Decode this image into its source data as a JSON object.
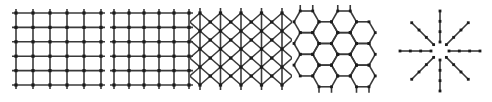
{
  "figure": {
    "background_color": "#ffffff",
    "line_color": "#3a3a3a",
    "node_color": "#1c1c1c",
    "panel_count": 5,
    "width": 492,
    "height": 102
  },
  "panels": [
    {
      "id": "panel-square-grid-1",
      "name": "square-lattice",
      "label": "Square grid",
      "type": "grid",
      "x": 16,
      "y": 13,
      "width": 85,
      "height": 72,
      "cols": 5,
      "rows": 5,
      "node_size": 3.2,
      "has_stubs": true,
      "stub_length": 4
    },
    {
      "id": "panel-square-grid-2",
      "name": "square-lattice-narrow",
      "label": "Square grid narrow",
      "type": "grid",
      "x": 114,
      "y": 13,
      "width": 75,
      "height": 72,
      "cols": 5,
      "rows": 5,
      "node_size": 3.2,
      "has_stubs": true,
      "stub_length": 4
    },
    {
      "id": "panel-triangular",
      "name": "triangular-lattice",
      "label": "Triangular lattice",
      "type": "triangular",
      "x": 200,
      "y": 13,
      "width": 82,
      "height": 72,
      "cols": 4,
      "rows": 4,
      "node_size": 3.2,
      "has_stubs": true,
      "stub_length": 5
    },
    {
      "id": "panel-hexagonal",
      "name": "hexagonal-lattice",
      "label": "Honeycomb lattice",
      "type": "hexagonal",
      "x": 294,
      "y": 11,
      "width": 86,
      "height": 76,
      "cols": 4,
      "rows": 3,
      "hex_radius": 12.5,
      "node_size": 2.8,
      "has_stubs": true,
      "stub_length": 6
    },
    {
      "id": "panel-radial-star",
      "name": "radial-star-lattice",
      "label": "Radial star",
      "type": "star",
      "x": 397,
      "y": 12,
      "width": 86,
      "height": 78,
      "spokes": 8,
      "nodes_per_spoke": 4,
      "inner_gap": 9,
      "outer_radius": 40,
      "node_size": 2.8
    }
  ]
}
